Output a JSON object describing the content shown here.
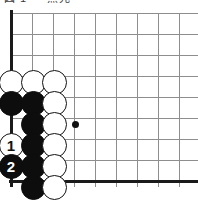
{
  "figure": {
    "title_fragment": "図 1 — 黒先",
    "board_size_shown": "corner diagram",
    "grid": {
      "columns": 9,
      "rows": 9,
      "spacing_px": 21,
      "origin_x_px": 11,
      "origin_y_px": 13,
      "left_edge_is_board_border": true,
      "bottom_edge_is_board_border": true,
      "line_color": "#8e8e8e",
      "border_color": "#1a1a1a",
      "background_color": "#ffffff"
    },
    "star_points": [
      {
        "name": "star-point-d6",
        "col": 4,
        "row": 6,
        "x": 75,
        "y": 124
      }
    ],
    "stones": [
      {
        "name": "stone-white-a4",
        "color": "white",
        "col": 1,
        "row": 4,
        "x": 11,
        "y": 82,
        "label": ""
      },
      {
        "name": "stone-white-b4",
        "color": "white",
        "col": 2,
        "row": 4,
        "x": 33,
        "y": 82,
        "label": ""
      },
      {
        "name": "stone-white-c4",
        "color": "white",
        "col": 3,
        "row": 4,
        "x": 54,
        "y": 82,
        "label": ""
      },
      {
        "name": "stone-black-a5",
        "color": "black",
        "col": 1,
        "row": 5,
        "x": 11,
        "y": 103,
        "label": ""
      },
      {
        "name": "stone-black-b5",
        "color": "black",
        "col": 2,
        "row": 5,
        "x": 33,
        "y": 103,
        "label": ""
      },
      {
        "name": "stone-white-c5",
        "color": "white",
        "col": 3,
        "row": 5,
        "x": 54,
        "y": 103,
        "label": ""
      },
      {
        "name": "stone-black-b6",
        "color": "black",
        "col": 2,
        "row": 6,
        "x": 33,
        "y": 124,
        "label": ""
      },
      {
        "name": "stone-white-c6",
        "color": "white",
        "col": 3,
        "row": 6,
        "x": 54,
        "y": 124,
        "label": ""
      },
      {
        "name": "stone-white-move-1",
        "color": "white",
        "col": 1,
        "row": 7,
        "x": 11,
        "y": 145,
        "label": "1"
      },
      {
        "name": "stone-black-b7",
        "color": "black",
        "col": 2,
        "row": 7,
        "x": 33,
        "y": 145,
        "label": ""
      },
      {
        "name": "stone-white-c7",
        "color": "white",
        "col": 3,
        "row": 7,
        "x": 54,
        "y": 145,
        "label": ""
      },
      {
        "name": "stone-black-move-2",
        "color": "black",
        "col": 1,
        "row": 8,
        "x": 11,
        "y": 166,
        "label": "2"
      },
      {
        "name": "stone-black-b8",
        "color": "black",
        "col": 2,
        "row": 8,
        "x": 33,
        "y": 166,
        "label": ""
      },
      {
        "name": "stone-white-c8",
        "color": "white",
        "col": 3,
        "row": 8,
        "x": 54,
        "y": 166,
        "label": ""
      },
      {
        "name": "stone-black-b9",
        "color": "black",
        "col": 2,
        "row": 9,
        "x": 33,
        "y": 187,
        "label": ""
      },
      {
        "name": "stone-white-c9",
        "color": "white",
        "col": 3,
        "row": 9,
        "x": 54,
        "y": 187,
        "label": ""
      }
    ],
    "move_numbers": [
      {
        "number": "1",
        "stone_color": "white",
        "text_color": "#111111"
      },
      {
        "number": "2",
        "stone_color": "black",
        "text_color": "#ffffff"
      }
    ]
  }
}
